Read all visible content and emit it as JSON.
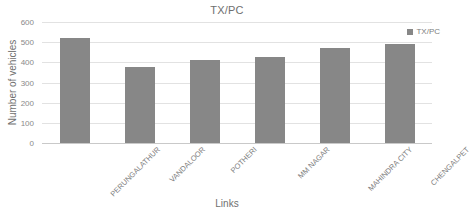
{
  "chart_data": {
    "type": "bar",
    "title": "TX/PC",
    "xlabel": "Links",
    "ylabel": "Number of vehicles",
    "categories": [
      "PERUNGALATHUR",
      "VANDALOOR",
      "POTHERI",
      "MM NAGAR",
      "MAHINDRA CITY",
      "CHENGALPET"
    ],
    "values": [
      520,
      378,
      410,
      425,
      470,
      492
    ],
    "series": [
      {
        "name": "TX/PC",
        "values": [
          520,
          378,
          410,
          425,
          470,
          492
        ]
      }
    ],
    "ylim": [
      0,
      600
    ],
    "yticks": [
      0,
      100,
      200,
      300,
      400,
      500,
      600
    ],
    "ytick_labels": [
      "0",
      "100",
      "200",
      "300",
      "400",
      "500",
      "600"
    ],
    "grid": true,
    "legend": {
      "position": "top-right",
      "entries": [
        {
          "label": "TX/PC",
          "color": "#878787",
          "marker": "square-swatch"
        }
      ]
    },
    "bar_color": "#878787",
    "gridline_color": "#e2e2e2",
    "text_color": "#7b7b7b",
    "background": "#ffffff",
    "xlabel_rotation_deg": -45
  }
}
